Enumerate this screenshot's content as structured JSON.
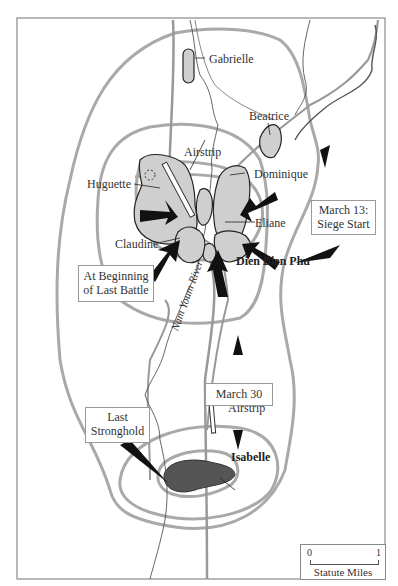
{
  "map": {
    "title": "Dien Bien Phu",
    "strongpoints": {
      "gabrielle": "Gabrielle",
      "beatrice": "Beatrice",
      "airstrip_north": "Airstrip",
      "huguette": "Huguette",
      "dominique": "Dominique",
      "eliane": "Eliane",
      "claudine": "Claudine",
      "dien_bien_phu": "Dien Bien Phu",
      "airstrip_south": "Airstrip",
      "isabelle": "Isabelle"
    },
    "river": "Nam Youm River",
    "callouts": {
      "siege_start_line1": "March 13:",
      "siege_start_line2": "Siege Start",
      "last_battle_line1": "At Beginning",
      "last_battle_line2": "of Last Battle",
      "march30": "March 30",
      "last_stronghold_line1": "Last",
      "last_stronghold_line2": "Stronghold"
    },
    "scale": {
      "min": "0",
      "max": "1",
      "unit": "Statute Miles"
    },
    "colors": {
      "perimeter": "#a9a9a9",
      "strongpoint_fill": "#cfcfcf",
      "last_stronghold_fill": "#555555",
      "arrow": "#111111",
      "frame": "#888888"
    }
  }
}
